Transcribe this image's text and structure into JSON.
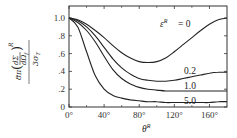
{
  "chart_data": {
    "type": "line",
    "title": "",
    "xlabel": "θ^R",
    "ylabel": "(8π/(3σ_T)) (dΣ/dΩ_f)^R",
    "xlim": [
      0,
      180
    ],
    "ylim": [
      0,
      1.05
    ],
    "x_ticks": [
      "0°",
      "40°",
      "80°",
      "120°",
      "160°"
    ],
    "y_ticks": [
      "0",
      ".2",
      ".4",
      ".6",
      ".8",
      "1.0"
    ],
    "grid": false,
    "legend": "inline labels",
    "x": [
      0,
      10,
      20,
      30,
      40,
      50,
      60,
      70,
      80,
      90,
      100,
      110,
      120,
      130,
      140,
      150,
      160,
      170,
      180
    ],
    "series": [
      {
        "name": "ε_i^R = 0",
        "values": [
          1.0,
          0.98,
          0.93,
          0.86,
          0.78,
          0.69,
          0.61,
          0.55,
          0.51,
          0.5,
          0.51,
          0.55,
          0.62,
          0.7,
          0.78,
          0.86,
          0.93,
          0.98,
          1.0
        ]
      },
      {
        "name": "0.2",
        "values": [
          1.0,
          0.97,
          0.9,
          0.8,
          0.67,
          0.54,
          0.44,
          0.37,
          0.32,
          0.3,
          0.29,
          0.29,
          0.3,
          0.32,
          0.34,
          0.36,
          0.38,
          0.39,
          0.39
        ]
      },
      {
        "name": "1.0",
        "values": [
          1.0,
          0.95,
          0.86,
          0.73,
          0.57,
          0.42,
          0.32,
          0.26,
          0.22,
          0.2,
          0.19,
          0.18,
          0.18,
          0.18,
          0.18,
          0.18,
          0.18,
          0.18,
          0.18
        ]
      },
      {
        "name": "5.0",
        "values": [
          1.0,
          0.9,
          0.62,
          0.35,
          0.2,
          0.13,
          0.1,
          0.08,
          0.07,
          0.06,
          0.06,
          0.05,
          0.05,
          0.05,
          0.05,
          0.05,
          0.05,
          0.06,
          0.06
        ]
      }
    ],
    "annotations": [
      "ε_i^R = 0",
      "0.2",
      "1.0",
      "5.0"
    ]
  },
  "labels": {
    "curve0": "= 0",
    "curve0_sym": "ε",
    "curve1": "0.2",
    "curve2": "1.0",
    "curve3": "5.0",
    "xlabel": "θ",
    "sup": "R"
  }
}
